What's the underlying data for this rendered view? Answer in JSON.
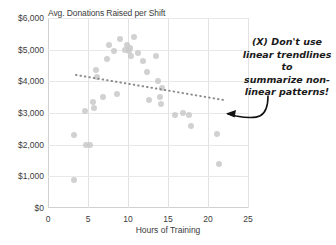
{
  "chart_data": {
    "type": "scatter",
    "title": "Avg. Donations Raised per Shift",
    "xlabel": "Hours of Training",
    "ylabel": "Avg. Donations Raised per Shift",
    "xlim": [
      0,
      25
    ],
    "ylim": [
      0,
      6000
    ],
    "xticks": [
      "0",
      "5",
      "10",
      "15",
      "20",
      "25"
    ],
    "xtick_values": [
      0,
      5,
      10,
      15,
      20,
      25
    ],
    "yticks": [
      "$0",
      "$1,000",
      "$2,000",
      "$3,000",
      "$4,000",
      "$5,000",
      "$6,000"
    ],
    "ytick_values": [
      0,
      1000,
      2000,
      3000,
      4000,
      5000,
      6000
    ],
    "grid": true,
    "legend": "none",
    "dot_color": "#c9c9c9",
    "trendline_color": "#8a8a8a",
    "annotation_color": "#1a1a1a",
    "points": [
      {
        "x": 3.2,
        "y": 2300
      },
      {
        "x": 3.3,
        "y": 900
      },
      {
        "x": 4.6,
        "y": 3050
      },
      {
        "x": 4.7,
        "y": 2000
      },
      {
        "x": 5.2,
        "y": 1980
      },
      {
        "x": 5.6,
        "y": 3350
      },
      {
        "x": 5.7,
        "y": 3150
      },
      {
        "x": 6.0,
        "y": 4350
      },
      {
        "x": 6.1,
        "y": 4150
      },
      {
        "x": 6.9,
        "y": 3500
      },
      {
        "x": 7.4,
        "y": 4700
      },
      {
        "x": 7.6,
        "y": 5150
      },
      {
        "x": 8.3,
        "y": 4950
      },
      {
        "x": 8.6,
        "y": 3600
      },
      {
        "x": 9.0,
        "y": 5350
      },
      {
        "x": 9.6,
        "y": 5000
      },
      {
        "x": 9.9,
        "y": 5150
      },
      {
        "x": 10.1,
        "y": 4950
      },
      {
        "x": 10.2,
        "y": 5050
      },
      {
        "x": 10.4,
        "y": 4800
      },
      {
        "x": 10.8,
        "y": 5400
      },
      {
        "x": 11.3,
        "y": 4900
      },
      {
        "x": 11.9,
        "y": 4650
      },
      {
        "x": 12.4,
        "y": 4300
      },
      {
        "x": 12.6,
        "y": 3400
      },
      {
        "x": 13.5,
        "y": 4800
      },
      {
        "x": 13.7,
        "y": 4000
      },
      {
        "x": 14.0,
        "y": 3500
      },
      {
        "x": 14.1,
        "y": 3300
      },
      {
        "x": 14.3,
        "y": 3800
      },
      {
        "x": 15.9,
        "y": 2950
      },
      {
        "x": 16.9,
        "y": 3000
      },
      {
        "x": 17.6,
        "y": 2950
      },
      {
        "x": 17.9,
        "y": 2600
      },
      {
        "x": 21.1,
        "y": 2350
      },
      {
        "x": 21.4,
        "y": 1400
      }
    ],
    "trendline": {
      "type": "linear",
      "x_start": 3.5,
      "y_start": 4200,
      "x_end": 22.2,
      "y_end": 3400,
      "style": "dotted"
    },
    "annotation": {
      "text": "(X) Don't use linear trendlines to summarize non-linear patterns!",
      "lines": [
        "(X) Don't use",
        "linear trendlines to",
        "summarize non-",
        "linear patterns!"
      ],
      "arrow": "curved-arrow-pointing-left-to-trendline"
    }
  }
}
